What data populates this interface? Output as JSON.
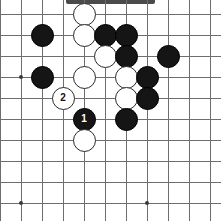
{
  "app": {
    "title": "Go Board Diagram",
    "top_bar_present": true
  },
  "board": {
    "type": "go-board-diagram",
    "columns": 10,
    "rows": 10,
    "spacing_px": 21,
    "origin_x": 21,
    "origin_y": 14,
    "line_color": "#6e6e6e",
    "background_color": "#ffffff",
    "black_color": "#151515",
    "white_color": "#ffffff",
    "star_points": [
      {
        "col": 0,
        "row": 3
      },
      {
        "col": 6,
        "row": 3
      },
      {
        "col": 0,
        "row": 9
      },
      {
        "col": 6,
        "row": 9
      }
    ],
    "stones": [
      {
        "color": "black",
        "col": 1,
        "row": 1,
        "label": ""
      },
      {
        "color": "white",
        "col": 3,
        "row": 0,
        "label": ""
      },
      {
        "color": "white",
        "col": 3,
        "row": 1,
        "label": ""
      },
      {
        "color": "black",
        "col": 4,
        "row": 1,
        "label": ""
      },
      {
        "color": "black",
        "col": 5,
        "row": 1,
        "label": ""
      },
      {
        "color": "white",
        "col": 4,
        "row": 2,
        "label": ""
      },
      {
        "color": "black",
        "col": 5,
        "row": 2,
        "label": ""
      },
      {
        "color": "black",
        "col": 7,
        "row": 2,
        "label": ""
      },
      {
        "color": "black",
        "col": 1,
        "row": 3,
        "label": ""
      },
      {
        "color": "white",
        "col": 3,
        "row": 3,
        "label": ""
      },
      {
        "color": "white",
        "col": 5,
        "row": 3,
        "label": ""
      },
      {
        "color": "black",
        "col": 6,
        "row": 3,
        "label": ""
      },
      {
        "color": "white",
        "col": 2,
        "row": 4,
        "label": "2"
      },
      {
        "color": "white",
        "col": 5,
        "row": 4,
        "label": ""
      },
      {
        "color": "black",
        "col": 6,
        "row": 4,
        "label": ""
      },
      {
        "color": "black",
        "col": 3,
        "row": 5,
        "label": "1"
      },
      {
        "color": "black",
        "col": 5,
        "row": 5,
        "label": ""
      },
      {
        "color": "white",
        "col": 3,
        "row": 6,
        "label": ""
      }
    ],
    "move_markers": [
      {
        "number": "1",
        "color": "black",
        "col": 3,
        "row": 5
      },
      {
        "number": "2",
        "color": "white",
        "col": 2,
        "row": 4
      }
    ]
  }
}
